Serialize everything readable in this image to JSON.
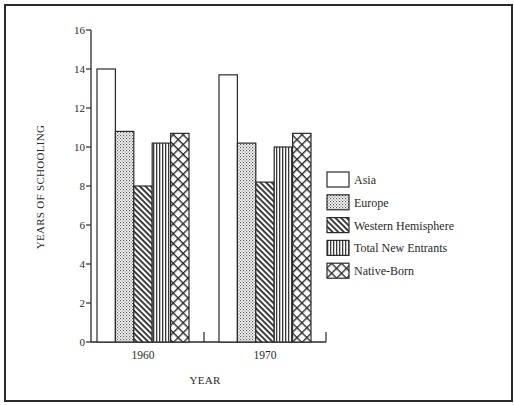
{
  "chart_data": {
    "type": "bar",
    "title": "",
    "xlabel": "YEAR",
    "ylabel": "YEARS OF SCHOOLING",
    "ylim": [
      0,
      16
    ],
    "yticks": [
      0,
      2,
      4,
      6,
      8,
      10,
      12,
      14,
      16
    ],
    "grid": false,
    "legend_position": "right",
    "categories": [
      "1960",
      "1970"
    ],
    "series": [
      {
        "name": "Asia",
        "pattern": "blank",
        "values": [
          14.0,
          13.7
        ]
      },
      {
        "name": "Europe",
        "pattern": "dots",
        "values": [
          10.8,
          10.2
        ]
      },
      {
        "name": "Western Hemisphere",
        "pattern": "diagonal",
        "values": [
          8.0,
          8.2
        ]
      },
      {
        "name": "Total New Entrants",
        "pattern": "vertical",
        "values": [
          10.2,
          10.0
        ]
      },
      {
        "name": "Native-Born",
        "pattern": "crosshatch",
        "values": [
          10.7,
          10.7
        ]
      }
    ]
  },
  "colors": {
    "ink": "#2a2a2a",
    "paper": "#ffffff"
  }
}
